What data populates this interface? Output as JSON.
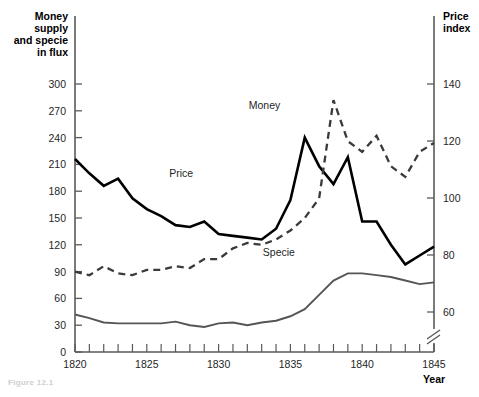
{
  "figure": {
    "caption": "Figure 12.1"
  },
  "axes": {
    "left_title_lines": [
      "Money",
      "supply",
      "and specie",
      "in flux"
    ],
    "right_title_lines": [
      "Price",
      "index"
    ],
    "x_title": "Year",
    "left_ticks": [
      0,
      30,
      60,
      90,
      120,
      150,
      180,
      210,
      240,
      270,
      300
    ],
    "right_ticks": [
      60,
      80,
      100,
      120,
      140
    ],
    "x_ticks_labeled": [
      1820,
      1825,
      1830,
      1835,
      1840,
      1845
    ],
    "x_ticks_all": [
      1820,
      1821,
      1822,
      1823,
      1824,
      1825,
      1826,
      1827,
      1828,
      1829,
      1830,
      1831,
      1832,
      1833,
      1834,
      1835,
      1836,
      1837,
      1838,
      1839,
      1840,
      1841,
      1842,
      1843,
      1844,
      1845
    ],
    "has_right_axis_break": true,
    "left_axis_range": [
      0,
      300
    ],
    "right_axis_range": [
      50,
      140
    ]
  },
  "chart_data": {
    "type": "line",
    "title": "",
    "subtitle": "",
    "xlabel": "Year",
    "ylabel": "Money supply and specie in flux",
    "y2label": "Price index",
    "xlim": [
      1820,
      1845
    ],
    "ylim": [
      0,
      300
    ],
    "y2lim": [
      50,
      140
    ],
    "grid": false,
    "legend": "inline-labels",
    "x": [
      1820,
      1821,
      1822,
      1823,
      1824,
      1825,
      1826,
      1827,
      1828,
      1829,
      1830,
      1831,
      1832,
      1833,
      1834,
      1835,
      1836,
      1837,
      1838,
      1839,
      1840,
      1841,
      1842,
      1843,
      1844,
      1845
    ],
    "series": [
      {
        "name": "Price",
        "axis": "left",
        "style": "solid-black",
        "label_x": 1827.4,
        "label_y": 196,
        "values": [
          216,
          200,
          186,
          194,
          172,
          160,
          152,
          142,
          140,
          146,
          132,
          130,
          128,
          126,
          138,
          170,
          240,
          208,
          188,
          218,
          146,
          146,
          120,
          98,
          108,
          118
        ]
      },
      {
        "name": "Money",
        "axis": "left",
        "style": "dashed-gray",
        "label_x": 1833.2,
        "label_y": 272,
        "values": [
          90,
          86,
          96,
          88,
          86,
          92,
          92,
          96,
          94,
          104,
          104,
          116,
          122,
          120,
          126,
          136,
          150,
          172,
          282,
          236,
          224,
          242,
          208,
          196,
          224,
          234
        ]
      },
      {
        "name": "Specie",
        "axis": "left",
        "style": "solid-gray",
        "label_x": 1834.2,
        "label_y": 108,
        "values": [
          42,
          38,
          33,
          32,
          32,
          32,
          32,
          34,
          30,
          28,
          32,
          33,
          30,
          33,
          35,
          40,
          48,
          64,
          80,
          88,
          88,
          86,
          84,
          80,
          76,
          78
        ]
      }
    ],
    "price_right_axis_values": [
      106,
      100,
      95,
      98,
      90,
      86,
      83,
      79,
      78,
      80,
      75,
      74,
      73,
      72,
      76,
      88,
      118,
      104,
      97,
      109,
      80,
      80,
      70,
      62,
      66,
      70
    ],
    "money_right_axis_values": [
      56,
      55,
      58,
      56,
      55,
      57,
      57,
      58,
      58,
      61,
      61,
      65,
      67,
      67,
      69,
      73,
      78,
      86,
      134,
      116,
      111,
      119,
      105,
      100,
      112,
      116
    ]
  },
  "series_labels": {
    "price": "Price",
    "money": "Money",
    "specie": "Specie"
  }
}
